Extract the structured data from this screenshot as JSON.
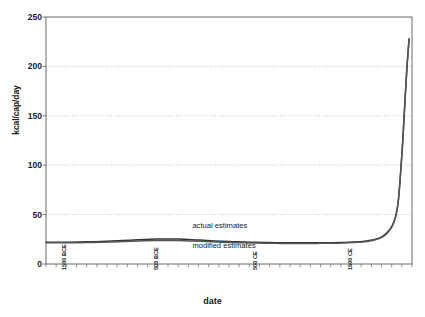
{
  "chart_data": {
    "type": "line",
    "title": "",
    "xlabel": "date",
    "ylabel": "kcal/cap/day",
    "ylim": [
      0,
      250
    ],
    "yticks": [
      0,
      50,
      100,
      150,
      200,
      250
    ],
    "grid": true,
    "grid_style": "dotted horizontal gridlines",
    "legend_position": "inline annotations on plot",
    "x_tick_labels": [
      {
        "label": "1500 BCE",
        "x_frac": 0.035
      },
      {
        "label": "500 BCE",
        "x_frac": 0.285
      },
      {
        "label": "500 CE",
        "x_frac": 0.555
      },
      {
        "label": "1500 CE",
        "x_frac": 0.815
      }
    ],
    "x_minor_tick_count": 36,
    "annotations": [
      {
        "text": "actual estimates",
        "x_frac": 0.4,
        "y_value": 38
      },
      {
        "text": "modified estimates",
        "x_frac": 0.4,
        "y_value": 18
      }
    ],
    "series": [
      {
        "name": "actual estimates",
        "color": "#333333",
        "x_frac": [
          0.0,
          0.03,
          0.06,
          0.09,
          0.12,
          0.15,
          0.18,
          0.21,
          0.24,
          0.27,
          0.3,
          0.33,
          0.36,
          0.39,
          0.42,
          0.45,
          0.48,
          0.51,
          0.54,
          0.57,
          0.6,
          0.63,
          0.66,
          0.69,
          0.72,
          0.75,
          0.78,
          0.81,
          0.84,
          0.87,
          0.895,
          0.915,
          0.93,
          0.945,
          0.955,
          0.962,
          0.968,
          0.974,
          0.98,
          0.986,
          0.992
        ],
        "values": [
          22.0,
          22.0,
          22.0,
          22.2,
          22.5,
          22.8,
          23.2,
          23.8,
          24.3,
          24.8,
          25.2,
          25.4,
          25.2,
          24.8,
          24.2,
          23.6,
          23.0,
          22.6,
          22.2,
          22.0,
          21.8,
          21.6,
          21.5,
          21.4,
          21.4,
          21.5,
          21.6,
          21.8,
          22.2,
          23.0,
          24.5,
          27.0,
          31.0,
          38.0,
          48.0,
          62.0,
          88.0,
          120.0,
          160.0,
          198.0,
          228.0
        ]
      },
      {
        "name": "modified estimates",
        "color": "#555555",
        "x_frac": [
          0.0,
          0.03,
          0.06,
          0.09,
          0.12,
          0.15,
          0.18,
          0.21,
          0.24,
          0.27,
          0.3,
          0.33,
          0.36,
          0.39,
          0.42,
          0.45,
          0.48,
          0.51,
          0.54,
          0.57,
          0.6,
          0.63,
          0.66,
          0.69,
          0.72,
          0.75,
          0.78,
          0.81,
          0.84,
          0.87,
          0.895,
          0.915,
          0.93,
          0.945,
          0.955,
          0.962,
          0.968,
          0.974,
          0.98,
          0.986,
          0.992
        ],
        "values": [
          21.4,
          21.4,
          21.5,
          21.6,
          21.8,
          22.0,
          22.3,
          22.7,
          23.1,
          23.5,
          23.8,
          23.9,
          23.7,
          23.3,
          22.9,
          22.4,
          22.0,
          21.7,
          21.4,
          21.2,
          21.0,
          20.9,
          20.8,
          20.8,
          20.8,
          20.9,
          21.0,
          21.3,
          21.8,
          22.6,
          24.0,
          26.5,
          30.5,
          37.5,
          47.5,
          61.5,
          87.5,
          119.5,
          159.5,
          197.5,
          227.5
        ]
      }
    ]
  },
  "axes": {
    "y_title": "kcal/cap/day",
    "x_title": "date",
    "y_tick_0": "0",
    "y_tick_1": "50",
    "y_tick_2": "100",
    "y_tick_3": "150",
    "y_tick_4": "200",
    "y_tick_5": "250"
  },
  "colors": {
    "plot_border": "#6b6b6b",
    "gridline": "#b8b8b8",
    "line_primary": "#333333",
    "line_secondary": "#555555",
    "background": "#ffffff",
    "text": "#1a1a1a"
  }
}
